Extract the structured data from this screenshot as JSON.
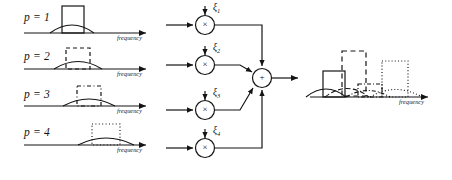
{
  "figure": {
    "type": "block-diagram",
    "stroke_color": "#141414",
    "background": "#ffffff"
  },
  "input_panels": [
    {
      "id": "p1",
      "label": "p = 1",
      "axis_label": "frequency",
      "line_style": "solid",
      "rect": {
        "x": 62,
        "y": 6,
        "w": 22,
        "h": 26
      },
      "hump": {
        "cx": 72,
        "half_width": 22,
        "height": 10
      },
      "axis": {
        "x1": 24,
        "x2": 150,
        "y": 33
      }
    },
    {
      "id": "p2",
      "label": "p = 2",
      "axis_label": "frequency",
      "line_style": "dashed",
      "rect": {
        "x": 66,
        "y": 46,
        "w": 24,
        "h": 21
      },
      "hump": {
        "cx": 78,
        "half_width": 24,
        "height": 9
      },
      "axis": {
        "x1": 24,
        "x2": 150,
        "y": 69
      }
    },
    {
      "id": "p3",
      "label": "p = 3",
      "axis_label": "frequency",
      "line_style": "dash-dot",
      "rect": {
        "x": 76,
        "y": 84,
        "w": 24,
        "h": 20
      },
      "hump": {
        "cx": 89,
        "half_width": 26,
        "height": 9
      },
      "axis": {
        "x1": 24,
        "x2": 150,
        "y": 106
      }
    },
    {
      "id": "p4",
      "label": "p = 4",
      "axis_label": "frequency",
      "line_style": "dotted",
      "rect": {
        "x": 92,
        "y": 121,
        "w": 28,
        "h": 21
      },
      "hump": {
        "cx": 106,
        "half_width": 28,
        "height": 8
      },
      "axis": {
        "x1": 24,
        "x2": 150,
        "y": 145
      }
    }
  ],
  "multipliers": [
    {
      "id": "mul1",
      "symbol": "×",
      "coefficient": "ξ",
      "subscript": "1",
      "cx": 205,
      "cy": 25
    },
    {
      "id": "mul2",
      "symbol": "×",
      "coefficient": "ξ",
      "subscript": "2",
      "cx": 205,
      "cy": 65
    },
    {
      "id": "mul3",
      "symbol": "×",
      "coefficient": "ξ",
      "subscript": "3",
      "cx": 205,
      "cy": 110
    },
    {
      "id": "mul4",
      "symbol": "×",
      "coefficient": "ξ",
      "subscript": "4",
      "cx": 205,
      "cy": 148
    }
  ],
  "summing_junction": {
    "id": "sum",
    "symbol": "+",
    "cx": 262,
    "cy": 78,
    "radius": 9
  },
  "output_panel": {
    "id": "output-spectrum",
    "axis_label": "frequency",
    "axis": {
      "x1": 310,
      "x2": 432,
      "y": 97
    },
    "rects": [
      {
        "style": "solid",
        "x": 323,
        "y": 70,
        "w": 22,
        "h": 26
      },
      {
        "style": "dashed",
        "x": 342,
        "y": 50,
        "w": 24,
        "h": 45
      },
      {
        "style": "dash-dot",
        "x": 358,
        "y": 83,
        "w": 24,
        "h": 13
      },
      {
        "style": "dotted",
        "x": 382,
        "y": 60,
        "w": 26,
        "h": 36
      }
    ],
    "humps": [
      {
        "style": "solid",
        "cx": 326,
        "half_width": 20,
        "height": 10
      },
      {
        "style": "dashed",
        "cx": 347,
        "half_width": 22,
        "height": 11
      },
      {
        "style": "dash-dot",
        "cx": 368,
        "half_width": 22,
        "height": 9
      },
      {
        "style": "dotted",
        "cx": 396,
        "half_width": 26,
        "height": 10
      }
    ]
  }
}
